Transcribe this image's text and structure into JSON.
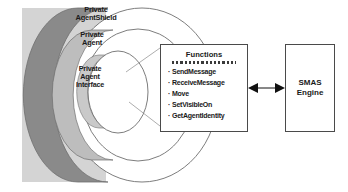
{
  "diagram": {
    "background_color": "#ffffff",
    "shell": {
      "panel_color": "#d0d0d0",
      "extrusion_dark_color": "#808080",
      "extrusion_light_color": "#c4c4c4",
      "outline_color": "#6e6e6e",
      "face_color": "#ffffff",
      "layers": [
        {
          "name": "private-agent-shield",
          "label": "Private\nAgentShield"
        },
        {
          "name": "private-agent",
          "label": "Private\nAgent"
        },
        {
          "name": "private-agent-interface",
          "label": "Private\nAgent\nInterface"
        }
      ]
    },
    "functions_box": {
      "title": "Functions",
      "separator": "==============",
      "items": [
        "SendMessage",
        "ReceiveMessage",
        "Move",
        "SetVisibleOn",
        "GetAgentIdentity"
      ],
      "footnote": "",
      "border_color": "#4a4a4a"
    },
    "engine_box": {
      "label": "SMAS\nEngine",
      "border_color": "#4a4a4a"
    },
    "connectors": {
      "interface_to_functions": "leader-lines",
      "functions_to_engine": "double-headed-arrow",
      "arrow_color": "#111111"
    }
  }
}
